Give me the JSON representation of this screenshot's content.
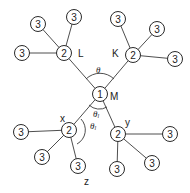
{
  "diagram": {
    "type": "tree",
    "root": {
      "id": "M",
      "value": "1",
      "label": "M"
    },
    "nodes": [
      {
        "id": "M",
        "value": "1",
        "label": "M",
        "x": 100,
        "y": 94
      },
      {
        "id": "L",
        "value": "2",
        "label": "L",
        "x": 64,
        "y": 53
      },
      {
        "id": "K",
        "value": "2",
        "label": "K",
        "x": 133,
        "y": 55
      },
      {
        "id": "x",
        "value": "2",
        "label": "x",
        "x": 69,
        "y": 130
      },
      {
        "id": "y",
        "value": "2",
        "label": "y",
        "x": 118,
        "y": 134
      },
      {
        "id": "L1",
        "value": "3",
        "x": 38,
        "y": 24
      },
      {
        "id": "L2",
        "value": "3",
        "x": 74,
        "y": 17
      },
      {
        "id": "L3",
        "value": "3",
        "x": 22,
        "y": 53
      },
      {
        "id": "K1",
        "value": "3",
        "x": 118,
        "y": 19
      },
      {
        "id": "K2",
        "value": "3",
        "x": 157,
        "y": 29
      },
      {
        "id": "K3",
        "value": "3",
        "x": 175,
        "y": 59
      },
      {
        "id": "x1",
        "value": "3",
        "x": 21,
        "y": 132
      },
      {
        "id": "x2",
        "value": "3",
        "x": 42,
        "y": 157
      },
      {
        "id": "x3",
        "value": "3",
        "x": 78,
        "y": 166
      },
      {
        "id": "y1",
        "value": "3",
        "x": 170,
        "y": 134
      },
      {
        "id": "y2",
        "value": "3",
        "x": 152,
        "y": 163
      },
      {
        "id": "y3",
        "value": "3",
        "x": 117,
        "y": 169
      }
    ],
    "edges": [
      [
        "M",
        "L"
      ],
      [
        "M",
        "K"
      ],
      [
        "M",
        "x"
      ],
      [
        "M",
        "y"
      ],
      [
        "L",
        "L1"
      ],
      [
        "L",
        "L2"
      ],
      [
        "L",
        "L3"
      ],
      [
        "K",
        "K1"
      ],
      [
        "K",
        "K2"
      ],
      [
        "K",
        "K3"
      ],
      [
        "x",
        "x1"
      ],
      [
        "x",
        "x2"
      ],
      [
        "x",
        "x3"
      ],
      [
        "y",
        "y1"
      ],
      [
        "y",
        "y2"
      ],
      [
        "y",
        "y3"
      ]
    ],
    "labels": {
      "M": "M",
      "L": "L",
      "K": "K",
      "x": "x",
      "y": "y",
      "z": "z",
      "theta_top": "θ",
      "theta_l_upper": "θl",
      "theta_l_lower": "θl"
    }
  }
}
